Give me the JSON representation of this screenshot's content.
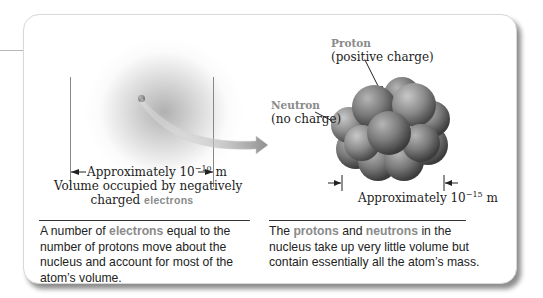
{
  "figure": {
    "electron_cloud": {
      "dimension_label_prefix": "Approximately 10",
      "dimension_exponent": "−10",
      "dimension_unit": " m",
      "volume_label_line1": "Volume occupied by negatively",
      "volume_label_line2_prefix": "charged ",
      "volume_label_highlight": "electrons"
    },
    "nucleus": {
      "proton_label": "Proton",
      "proton_sublabel": "(positive charge)",
      "neutron_label": "Neutron",
      "neutron_sublabel": "(no charge)",
      "dimension_label_prefix": "Approximately 10",
      "dimension_exponent": "−15",
      "dimension_unit": " m"
    },
    "captions": {
      "left": {
        "part1": "A number of ",
        "highlight": "electrons",
        "part2": " equal to the number of protons move about the nucleus and account for most of the atom’s volume."
      },
      "right": {
        "part1": "The ",
        "highlight1": "protons",
        "part2": " and ",
        "highlight2": "neutrons",
        "part3": " in the nucleus take up very little volume but contain essentially all the atom’s mass."
      }
    },
    "colors": {
      "accent_gray": "#8a8a8a",
      "text": "#222222",
      "shadow": "#555555"
    }
  }
}
